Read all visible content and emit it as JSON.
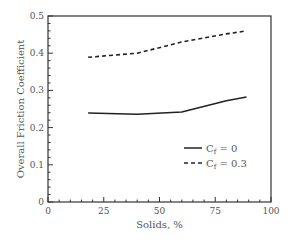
{
  "chart_data": {
    "type": "line",
    "title": "",
    "xlabel": "Solids, %",
    "ylabel": "Overall Friction Coefficient",
    "xlim": [
      0,
      100
    ],
    "ylim": [
      0,
      0.5
    ],
    "x_major_ticks": [
      0,
      25,
      50,
      75,
      100
    ],
    "x_tick_labels": [
      "0",
      "25",
      "50",
      "75",
      "100"
    ],
    "y_major_ticks": [
      0,
      0.1,
      0.2,
      0.3,
      0.4,
      0.5
    ],
    "y_tick_labels": [
      "0",
      "0.1",
      "0.2",
      "0.3",
      "0.4",
      "0.5"
    ],
    "x_minor_step": 5,
    "y_minor_step": 0.02,
    "grid": false,
    "legend_position": "lower right (inside)",
    "series": [
      {
        "name": "Cf = 0",
        "label_main": "C",
        "label_sub": "f",
        "label_rest": " = 0",
        "style": "solid",
        "color": "#222222",
        "x": [
          18,
          40,
          60,
          80,
          89
        ],
        "values": [
          0.239,
          0.236,
          0.242,
          0.272,
          0.282
        ]
      },
      {
        "name": "Cf = 0.3",
        "label_main": "C",
        "label_sub": "f",
        "label_rest": " = 0.3",
        "style": "dashed",
        "color": "#222222",
        "x": [
          18,
          40,
          60,
          80,
          89
        ],
        "values": [
          0.389,
          0.4,
          0.43,
          0.452,
          0.46
        ]
      }
    ]
  }
}
